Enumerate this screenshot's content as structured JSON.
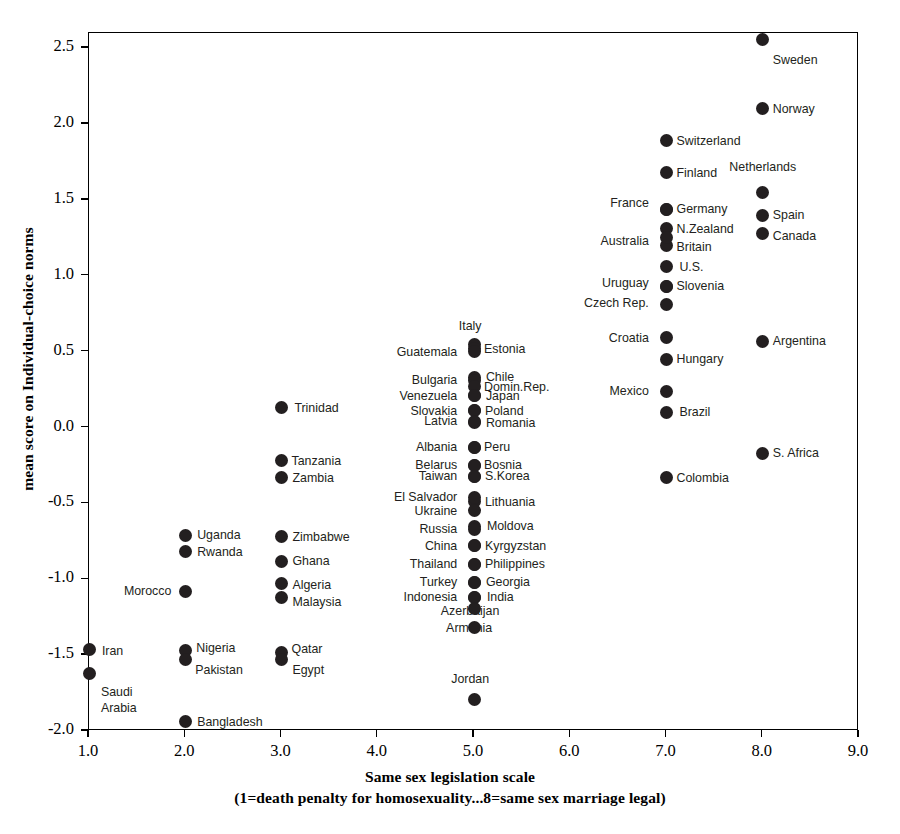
{
  "chart_data": {
    "type": "scatter",
    "title": "",
    "xlabel": "Same sex legislation scale",
    "xlabel_sub": "(1=death penalty for homosexuality...8=same sex marriage legal)",
    "ylabel": "mean score on Individual-choice norms",
    "xlim": [
      1.0,
      9.0
    ],
    "ylim": [
      -2.0,
      2.6
    ],
    "xticks": [
      "1.0",
      "2.0",
      "3.0",
      "4.0",
      "5.0",
      "6.0",
      "7.0",
      "8.0",
      "9.0"
    ],
    "xtick_values": [
      1.0,
      2.0,
      3.0,
      4.0,
      5.0,
      6.0,
      7.0,
      8.0,
      9.0
    ],
    "yticks": [
      "2.5",
      "2.0",
      "1.5",
      "1.0",
      "0.5",
      "0.0",
      "-0.5",
      "-1.0",
      "-1.5",
      "-2.0"
    ],
    "ytick_values": [
      2.5,
      2.0,
      1.5,
      1.0,
      0.5,
      0.0,
      -0.5,
      -1.0,
      -1.5,
      -2.0
    ],
    "grid": false,
    "legend": "none",
    "marker_color": "#231f20",
    "points": [
      {
        "label": "Sweden",
        "x": 8.0,
        "y": 2.56,
        "lp": "r",
        "lx": 8.0,
        "ly": 2.42
      },
      {
        "label": "Norway",
        "x": 8.0,
        "y": 2.1,
        "lp": "r",
        "lx": 8.0,
        "ly": 2.1
      },
      {
        "label": "Switzerland",
        "x": 7.0,
        "y": 1.89,
        "lp": "r",
        "lx": 7.0,
        "ly": 1.89
      },
      {
        "label": "Finland",
        "x": 7.0,
        "y": 1.68,
        "lp": "r",
        "lx": 7.0,
        "ly": 1.68
      },
      {
        "label": "Netherlands",
        "x": 8.0,
        "y": 1.55,
        "lp": "c",
        "lx": 8.0,
        "ly": 1.72
      },
      {
        "label": "Germany",
        "x": 7.0,
        "y": 1.44,
        "lp": "r",
        "lx": 7.0,
        "ly": 1.44
      },
      {
        "label": "France",
        "x": 7.0,
        "y": 1.44,
        "lp": "l",
        "lx": 6.92,
        "ly": 1.48
      },
      {
        "label": "Spain",
        "x": 8.0,
        "y": 1.4,
        "lp": "r",
        "lx": 8.0,
        "ly": 1.4
      },
      {
        "label": "N.Zealand",
        "x": 7.0,
        "y": 1.31,
        "lp": "r",
        "lx": 7.0,
        "ly": 1.31
      },
      {
        "label": "Canada",
        "x": 8.0,
        "y": 1.28,
        "lp": "r",
        "lx": 8.0,
        "ly": 1.26
      },
      {
        "label": "Britain",
        "x": 7.0,
        "y": 1.2,
        "lp": "r",
        "lx": 7.0,
        "ly": 1.19
      },
      {
        "label": "Australia",
        "x": 7.0,
        "y": 1.25,
        "lp": "l",
        "lx": 6.92,
        "ly": 1.23
      },
      {
        "label": "U.S.",
        "x": 7.0,
        "y": 1.06,
        "lp": "r",
        "lx": 7.03,
        "ly": 1.06
      },
      {
        "label": "Slovenia",
        "x": 7.0,
        "y": 0.93,
        "lp": "r",
        "lx": 7.0,
        "ly": 0.93
      },
      {
        "label": "Uruguay",
        "x": 7.0,
        "y": 0.93,
        "lp": "l",
        "lx": 6.92,
        "ly": 0.95
      },
      {
        "label": "Czech Rep.",
        "x": 7.0,
        "y": 0.81,
        "lp": "l",
        "lx": 6.92,
        "ly": 0.82
      },
      {
        "label": "Croatia",
        "x": 7.0,
        "y": 0.59,
        "lp": "l",
        "lx": 6.92,
        "ly": 0.59
      },
      {
        "label": "Argentina",
        "x": 8.0,
        "y": 0.57,
        "lp": "r",
        "lx": 8.0,
        "ly": 0.57
      },
      {
        "label": "Hungary",
        "x": 7.0,
        "y": 0.45,
        "lp": "r",
        "lx": 7.0,
        "ly": 0.45
      },
      {
        "label": "Mexico",
        "x": 7.0,
        "y": 0.24,
        "lp": "l",
        "lx": 6.92,
        "ly": 0.24
      },
      {
        "label": "Brazil",
        "x": 7.0,
        "y": 0.1,
        "lp": "r",
        "lx": 7.03,
        "ly": 0.1
      },
      {
        "label": "S. Africa",
        "x": 8.0,
        "y": -0.17,
        "lp": "r",
        "lx": 8.0,
        "ly": -0.17
      },
      {
        "label": "Colombia",
        "x": 7.0,
        "y": -0.33,
        "lp": "r",
        "lx": 7.0,
        "ly": -0.33
      },
      {
        "label": "Italy",
        "x": 5.0,
        "y": 0.55,
        "lp": "c",
        "lx": 4.96,
        "ly": 0.67
      },
      {
        "label": "Estonia",
        "x": 5.0,
        "y": 0.52,
        "lp": "r",
        "lx": 5.0,
        "ly": 0.52
      },
      {
        "label": "Guatemala",
        "x": 5.0,
        "y": 0.5,
        "lp": "l",
        "lx": 4.93,
        "ly": 0.5
      },
      {
        "label": "Chile",
        "x": 5.0,
        "y": 0.33,
        "lp": "r",
        "lx": 5.02,
        "ly": 0.33
      },
      {
        "label": "Bulgaria",
        "x": 5.0,
        "y": 0.31,
        "lp": "l",
        "lx": 4.93,
        "ly": 0.31
      },
      {
        "label": "Domin.Rep.",
        "x": 5.0,
        "y": 0.27,
        "lp": "r",
        "lx": 5.0,
        "ly": 0.27
      },
      {
        "label": "Japan",
        "x": 5.0,
        "y": 0.21,
        "lp": "r",
        "lx": 5.02,
        "ly": 0.21
      },
      {
        "label": "Venezuela",
        "x": 5.0,
        "y": 0.21,
        "lp": "l",
        "lx": 4.93,
        "ly": 0.21
      },
      {
        "label": "Poland",
        "x": 5.0,
        "y": 0.11,
        "lp": "r",
        "lx": 5.01,
        "ly": 0.11
      },
      {
        "label": "Slovakia",
        "x": 5.0,
        "y": 0.11,
        "lp": "l",
        "lx": 4.93,
        "ly": 0.11
      },
      {
        "label": "Romania",
        "x": 5.0,
        "y": 0.03,
        "lp": "r",
        "lx": 5.02,
        "ly": 0.03
      },
      {
        "label": "Latvia",
        "x": 5.0,
        "y": 0.04,
        "lp": "l",
        "lx": 4.93,
        "ly": 0.04
      },
      {
        "label": "Peru",
        "x": 5.0,
        "y": -0.13,
        "lp": "r",
        "lx": 5.0,
        "ly": -0.13
      },
      {
        "label": "Albania",
        "x": 5.0,
        "y": -0.13,
        "lp": "l",
        "lx": 4.93,
        "ly": -0.13
      },
      {
        "label": "Bosnia",
        "x": 5.0,
        "y": -0.25,
        "lp": "r",
        "lx": 5.0,
        "ly": -0.25
      },
      {
        "label": "Belarus",
        "x": 5.0,
        "y": -0.25,
        "lp": "l",
        "lx": 4.93,
        "ly": -0.25
      },
      {
        "label": "S.Korea",
        "x": 5.0,
        "y": -0.32,
        "lp": "r",
        "lx": 5.01,
        "ly": -0.32
      },
      {
        "label": "Taiwan",
        "x": 5.0,
        "y": -0.32,
        "lp": "l",
        "lx": 4.93,
        "ly": -0.32
      },
      {
        "label": "Lithuania",
        "x": 5.0,
        "y": -0.49,
        "lp": "r",
        "lx": 5.01,
        "ly": -0.49
      },
      {
        "label": "El Salvador",
        "x": 5.0,
        "y": -0.46,
        "lp": "l",
        "lx": 4.93,
        "ly": -0.46
      },
      {
        "label": "Ukraine",
        "x": 5.0,
        "y": -0.55,
        "lp": "l",
        "lx": 4.93,
        "ly": -0.55
      },
      {
        "label": "Moldova",
        "x": 5.0,
        "y": -0.65,
        "lp": "r",
        "lx": 5.03,
        "ly": -0.65
      },
      {
        "label": "Russia",
        "x": 5.0,
        "y": -0.67,
        "lp": "l",
        "lx": 4.93,
        "ly": -0.67
      },
      {
        "label": "Kyrgyzstan",
        "x": 5.0,
        "y": -0.78,
        "lp": "r",
        "lx": 5.01,
        "ly": -0.78
      },
      {
        "label": "China",
        "x": 5.0,
        "y": -0.78,
        "lp": "l",
        "lx": 4.93,
        "ly": -0.78
      },
      {
        "label": "Philippines",
        "x": 5.0,
        "y": -0.9,
        "lp": "r",
        "lx": 5.01,
        "ly": -0.9
      },
      {
        "label": "Thailand",
        "x": 5.0,
        "y": -0.9,
        "lp": "l",
        "lx": 4.93,
        "ly": -0.9
      },
      {
        "label": "Georgia",
        "x": 5.0,
        "y": -1.02,
        "lp": "r",
        "lx": 5.02,
        "ly": -1.02
      },
      {
        "label": "Turkey",
        "x": 5.0,
        "y": -1.02,
        "lp": "l",
        "lx": 4.93,
        "ly": -1.02
      },
      {
        "label": "India",
        "x": 5.0,
        "y": -1.12,
        "lp": "r",
        "lx": 5.03,
        "ly": -1.12
      },
      {
        "label": "Indonesia",
        "x": 5.0,
        "y": -1.12,
        "lp": "l",
        "lx": 4.93,
        "ly": -1.12
      },
      {
        "label": "Azerbaijan",
        "x": 5.0,
        "y": -1.19,
        "lp": "c",
        "lx": 4.96,
        "ly": -1.21
      },
      {
        "label": "Armenia",
        "x": 5.0,
        "y": -1.32,
        "lp": "c",
        "lx": 4.95,
        "ly": -1.32
      },
      {
        "label": "Jordan",
        "x": 5.0,
        "y": -1.79,
        "lp": "c",
        "lx": 4.96,
        "ly": -1.66
      },
      {
        "label": "Trinidad",
        "x": 3.0,
        "y": 0.13,
        "lp": "r",
        "lx": 3.03,
        "ly": 0.13
      },
      {
        "label": "Tanzania",
        "x": 3.0,
        "y": -0.22,
        "lp": "r",
        "lx": 3.0,
        "ly": -0.22
      },
      {
        "label": "Zambia",
        "x": 3.0,
        "y": -0.33,
        "lp": "r",
        "lx": 3.01,
        "ly": -0.33
      },
      {
        "label": "Zimbabwe",
        "x": 3.0,
        "y": -0.72,
        "lp": "r",
        "lx": 3.01,
        "ly": -0.72
      },
      {
        "label": "Ghana",
        "x": 3.0,
        "y": -0.88,
        "lp": "r",
        "lx": 3.01,
        "ly": -0.88
      },
      {
        "label": "Algeria",
        "x": 3.0,
        "y": -1.03,
        "lp": "r",
        "lx": 3.01,
        "ly": -1.04
      },
      {
        "label": "Malaysia",
        "x": 3.0,
        "y": -1.12,
        "lp": "r",
        "lx": 3.01,
        "ly": -1.15
      },
      {
        "label": "Qatar",
        "x": 3.0,
        "y": -1.48,
        "lp": "r",
        "lx": 3.0,
        "ly": -1.46
      },
      {
        "label": "Egypt",
        "x": 3.0,
        "y": -1.53,
        "lp": "r",
        "lx": 3.01,
        "ly": -1.6
      },
      {
        "label": "Uganda",
        "x": 2.0,
        "y": -0.71,
        "lp": "r",
        "lx": 2.02,
        "ly": -0.71
      },
      {
        "label": "Rwanda",
        "x": 2.0,
        "y": -0.82,
        "lp": "r",
        "lx": 2.02,
        "ly": -0.82
      },
      {
        "label": "Morocco",
        "x": 2.0,
        "y": -1.08,
        "lp": "l",
        "lx": 1.96,
        "ly": -1.08
      },
      {
        "label": "Nigeria",
        "x": 2.0,
        "y": -1.47,
        "lp": "r",
        "lx": 2.01,
        "ly": -1.45
      },
      {
        "label": "Pakistan",
        "x": 2.0,
        "y": -1.53,
        "lp": "r",
        "lx": 2.0,
        "ly": -1.6
      },
      {
        "label": "Bangladesh",
        "x": 2.0,
        "y": -1.94,
        "lp": "r",
        "lx": 2.02,
        "ly": -1.94
      },
      {
        "label": "Iran",
        "x": 1.0,
        "y": -1.46,
        "lp": "r",
        "lx": 1.03,
        "ly": -1.47
      },
      {
        "label": "Saudi",
        "x": 1.0,
        "y": -1.62,
        "lp": "r",
        "lx": 1.02,
        "ly": -1.74
      },
      {
        "label": "Arabia",
        "x": 1.0,
        "y": null,
        "lp": "r",
        "lx": 1.02,
        "ly": -1.85
      }
    ]
  }
}
